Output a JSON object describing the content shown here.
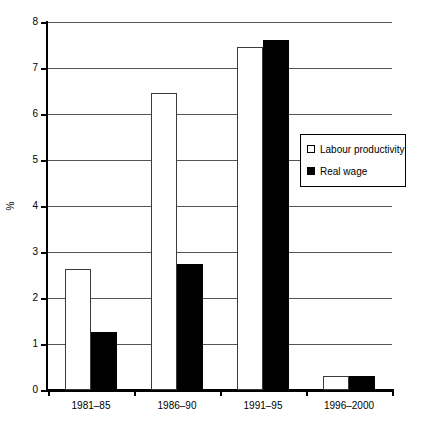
{
  "chart_data": {
    "type": "bar",
    "title": "",
    "subtitle": "",
    "xlabel": "",
    "ylabel": "%",
    "categories": [
      "1981–85",
      "1986–90",
      "1991–95",
      "1996–2000"
    ],
    "series": [
      {
        "name": "Labour productivity",
        "style": "open",
        "color": "#ffffff",
        "edge_color": "#3a3a3a",
        "values": [
          2.62,
          6.45,
          7.45,
          0.3
        ]
      },
      {
        "name": "Real wage",
        "style": "filled",
        "color": "#000000",
        "edge_color": "#000000",
        "values": [
          1.27,
          2.73,
          7.6,
          0.3
        ]
      }
    ],
    "ylim": [
      0,
      8
    ],
    "yticks": [
      0,
      1,
      2,
      3,
      4,
      5,
      6,
      7,
      8
    ],
    "ytick_labels": [
      "0",
      "1",
      "2",
      "3",
      "4",
      "5",
      "6",
      "7",
      "8"
    ],
    "grid": true,
    "grid_axis": "y",
    "legend_position": "upper right inside",
    "legend_entries": [
      "Labour productivity",
      "Real wage"
    ],
    "annotations": []
  },
  "axis": {
    "y_title": "%"
  }
}
